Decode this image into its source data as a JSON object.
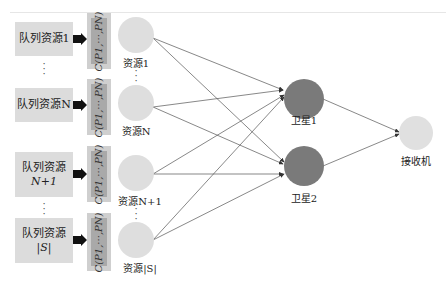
{
  "queues": [
    {
      "line1": "队列资源1",
      "line2": ""
    },
    {
      "line1": "队列资源N",
      "line2": ""
    },
    {
      "line1": "队列资源",
      "line2": "N+1"
    },
    {
      "line1": "队列资源",
      "line2": "|S|"
    }
  ],
  "cost_label": "C(P1,···,PN)",
  "resources": [
    {
      "label": "资源1"
    },
    {
      "label": "资源N"
    },
    {
      "label": "资源N+1"
    },
    {
      "label": "资源|S|"
    }
  ],
  "satellites": [
    {
      "label": "卫星1"
    },
    {
      "label": "卫星2"
    }
  ],
  "receiver": {
    "label": "接收机"
  },
  "ellipsis": "⋮",
  "colors": {
    "queue_fill": "#dcdcdc",
    "cost_outer": "#cfcfcf",
    "cost_inner": "#a9a9a9",
    "resource_node": "#dedede",
    "satellite_node": "#7a7a7a",
    "receiver_node": "#e0e0e0",
    "edge": "#555555"
  }
}
